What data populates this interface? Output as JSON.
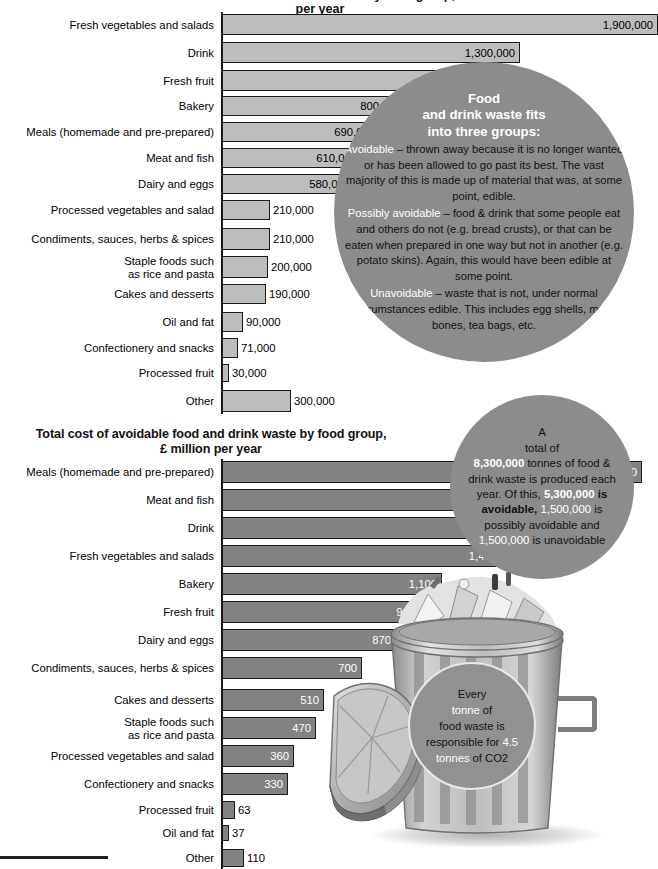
{
  "page": {
    "top_title_clipped": "Total amount of food and drink waste by food group, tonnes per year"
  },
  "chart_data": [
    {
      "type": "bar",
      "orientation": "horizontal",
      "id": "amount-chart",
      "title": "Total amount of food and drink waste by food group, tonnes per year",
      "xlabel": "",
      "ylabel": "",
      "xlim": [
        0,
        1900000
      ],
      "grid": false,
      "legend": "none",
      "categories": [
        "Fresh vegetables and salads",
        "Drink",
        "Fresh fruit",
        "Bakery",
        "Meals (homemade and pre-prepared)",
        "Meat and fish",
        "Dairy and eggs",
        "Processed vegetables and salad",
        "Condiments, sauces, herbs & spices",
        "Staple foods such\nas rice and pasta",
        "Cakes and desserts",
        "Oil and fat",
        "Confectionery and snacks",
        "Processed fruit",
        "Other"
      ],
      "values": [
        1900000,
        1300000,
        1100000,
        800000,
        690000,
        610000,
        580000,
        210000,
        210000,
        200000,
        190000,
        90000,
        71000,
        30000,
        300000
      ],
      "value_labels": [
        "1,900,000",
        "1,300,000",
        "1,100,000",
        "800,000",
        "690,000",
        "610,000",
        "580,000",
        "210,000",
        "210,000",
        "200,000",
        "190,000",
        "90,000",
        "71,000",
        "30,000",
        "300,000"
      ],
      "label_inside": [
        true,
        true,
        true,
        true,
        true,
        true,
        true,
        false,
        false,
        false,
        false,
        false,
        false,
        false,
        false
      ]
    },
    {
      "type": "bar",
      "orientation": "horizontal",
      "id": "cost-chart",
      "title": "Total cost of avoidable food and drink waste by food group,\n£ million per year",
      "title_line1": "Total cost of avoidable food and drink waste by food group,",
      "title_line2": "£ million per year",
      "xlabel": "",
      "ylabel": "",
      "xlim": [
        0,
        2100
      ],
      "grid": false,
      "legend": "none",
      "categories": [
        "Meals (homemade and pre-prepared)",
        "Meat and fish",
        "Drink",
        "Fresh vegetables and salads",
        "Bakery",
        "Fresh fruit",
        "Dairy and eggs",
        "Condiments, sauces, herbs & spices",
        "Cakes and desserts",
        "Staple foods such\nas rice and pasta",
        "Processed vegetables and salad",
        "Confectionery and snacks",
        "Processed fruit",
        "Oil and fat",
        "Other"
      ],
      "values": [
        2100,
        1600,
        1600,
        1400,
        1100,
        990,
        870,
        700,
        510,
        470,
        360,
        330,
        63,
        37,
        110
      ],
      "value_labels": [
        "2,100",
        "1,600",
        "1,600",
        "1,400",
        "1,100",
        "990",
        "870",
        "700",
        "510",
        "470",
        "360",
        "330",
        "63",
        "37",
        "110"
      ],
      "label_inside": [
        true,
        true,
        true,
        true,
        true,
        true,
        true,
        true,
        true,
        true,
        true,
        true,
        false,
        false,
        false
      ]
    }
  ],
  "groups_circle": {
    "heading_line1": "Food",
    "heading_line2": "and drink waste fits",
    "heading_line3": "into three groups:",
    "avoidable_term": "Avoidable",
    "avoidable_text": " – thrown away because it is no longer wanted or has been allowed to go past its best. The vast majority of this is made up of material that was, at some point, edible.",
    "possibly_term": "Possibly avoidable",
    "possibly_text": " – food & drink that some people eat and others do not (e.g. bread crusts), or that can be eaten when prepared in one way but not in another (e.g. potato skins). Again, this would have been edible at some point.",
    "unavoidable_term": "Unavoidable",
    "unavoidable_text": " – waste that is not, under normal circumstances edible. This includes egg shells, meat bones, tea bags, etc."
  },
  "total_circle": {
    "line_a": "A",
    "line_b": "total of",
    "total_tonnes": "8,300,000",
    "after_total": " tonnes of food & drink waste is produced each year. Of this, ",
    "avoidable_amount": "5,300,000",
    "avoidable_label": " is avoidable, ",
    "possibly_amount": "1,500,000",
    "possibly_label": " is possibly avoidable and ",
    "unavoidable_amount": "1,500,000",
    "unavoidable_label": " is unavoidable"
  },
  "co2_circle": {
    "word_every": "Every",
    "word_tonne": "tonne",
    "text_of": " of",
    "line_food_waste": "food waste  is",
    "line_responsible": "responsible for ",
    "value_45": "4.5",
    "word_tonnes": "tonnes",
    "text_co2": " of CO2"
  },
  "colors": {
    "circle_grey": "#8c8c8c",
    "bar_light": "#bdbdbd",
    "bar_dark": "#828282",
    "bar_outline": "#1a1a1a",
    "highlight_white": "#ffffff",
    "text_black": "#111111"
  },
  "icons": {
    "bin": "trash-bin-icon",
    "lid": "bin-lid-icon",
    "trash": "waste-pile-icon"
  }
}
